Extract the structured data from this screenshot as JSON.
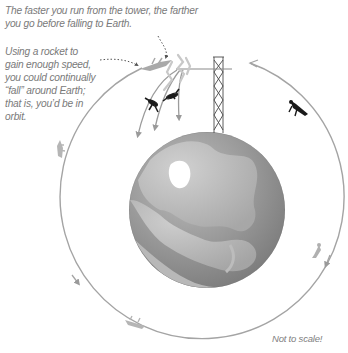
{
  "diagram": {
    "captions": {
      "top": "The faster you run from the tower, the farther you go before falling to Earth.",
      "left": "Using a rocket to gain enough speed, you could continually “fall” around Earth; that is, you’d be in orbit.",
      "scale_note": "Not to scale!"
    },
    "elements": {
      "earth": "globe-north-pole-view",
      "tower": "lattice-radio-tower",
      "orbit_path": "circular-orbit-counterclockwise",
      "figures": [
        "falling-person-near",
        "falling-person-far",
        "rocket-person-at-launch",
        "rocket-person-right",
        "rocket-person-lower-right",
        "rocket-person-bottom",
        "rocket-person-left"
      ]
    },
    "colors": {
      "text": "#7a7a7a",
      "orbit": "#a0a0a0",
      "earth_ocean": "#8c8c8c",
      "earth_land": "#b4b4b4",
      "ice": "#ffffff",
      "figure_dark": "#1a1a1a",
      "figure_light": "#b0b0b0"
    }
  }
}
